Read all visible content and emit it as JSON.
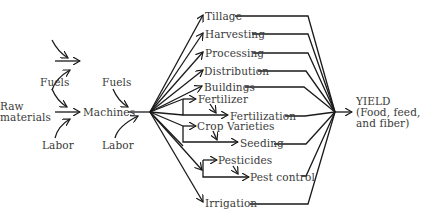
{
  "diagram": {
    "inputs": {
      "raw_materials": [
        "Raw",
        "materials"
      ],
      "fuels_1": "Fuels",
      "labor_1": "Labor",
      "machines": "Machines",
      "fuels_2": "Fuels",
      "labor_2": "Labor"
    },
    "branches": {
      "tillage": "Tillage",
      "harvesting": "Harvesting",
      "processing": "Processing",
      "distribution": "Distribution",
      "buildings": "Buildings",
      "fertilizer": "Fertilizer",
      "fertilization": "Fertilization",
      "crop_varieties": "Crop Varieties",
      "seeding": "Seeding",
      "pesticides": "Pesticides",
      "pest_control": "Pest control",
      "irrigation": "Irrigation"
    },
    "output": {
      "line1": "YIELD",
      "line2": "(Food, feed,",
      "line3": "and fiber)"
    },
    "colors": {
      "line": "#1a1a1a",
      "text": "#3a3a3a"
    }
  }
}
